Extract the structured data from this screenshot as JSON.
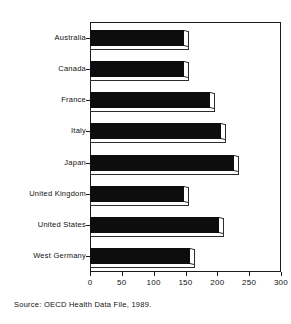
{
  "figure": {
    "top_artifact_text": "",
    "source_note": "Source: OECD Health Data File, 1989."
  },
  "chart_data": {
    "type": "bar",
    "orientation": "horizontal",
    "title": "",
    "subtitle": "",
    "xlabel": "",
    "ylabel": "",
    "categories": [
      "Australia",
      "Canada",
      "France",
      "Italy",
      "Japan",
      "United Kingdom",
      "United States",
      "West Germany"
    ],
    "values": [
      148,
      148,
      188,
      206,
      226,
      148,
      202,
      157
    ],
    "xlim": [
      0,
      300
    ],
    "xticks": [
      0,
      50,
      100,
      150,
      200,
      250,
      300
    ],
    "xtick_labels": [
      "0",
      "50",
      "100",
      "150",
      "200",
      "250",
      "300"
    ],
    "grid": false,
    "legend": false,
    "legend_position": "none",
    "bar_color": "#0d0d0d",
    "bar_style": "3d-shadow",
    "frame_color": "#1a1a1a",
    "background_color": "#ffffff"
  }
}
